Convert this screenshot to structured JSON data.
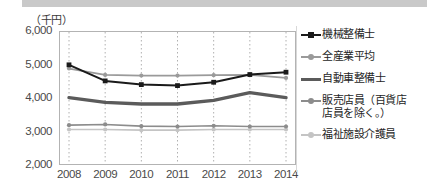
{
  "chart_data": {
    "type": "line",
    "title": "",
    "subtitle": "",
    "xlabel": "",
    "ylabel": "",
    "unit_label": "（千円）",
    "categories": [
      "2008",
      "2009",
      "2010",
      "2011",
      "2012",
      "2013",
      "2014"
    ],
    "ylim": [
      2000,
      6000
    ],
    "yticks": [
      "6,000",
      "5,000",
      "4,000",
      "3,000",
      "2,000"
    ],
    "ytick_values": [
      6000,
      5000,
      4000,
      3000,
      2000
    ],
    "grid": "vertical-dotted",
    "legend_position": "right",
    "series": [
      {
        "name": "機械整備士",
        "color": "#1a1a1a",
        "width": 2.0,
        "marker": "square",
        "values": [
          4990,
          4510,
          4400,
          4370,
          4470,
          4700,
          4770
        ]
      },
      {
        "name": "全産業平均",
        "color": "#9a9a9a",
        "width": 1.8,
        "marker": "dot",
        "values": [
          4880,
          4690,
          4670,
          4670,
          4680,
          4690,
          4600
        ]
      },
      {
        "name": "自動車整備士",
        "color": "#5b5b5b",
        "width": 3.4,
        "marker": "none",
        "values": [
          4010,
          3870,
          3820,
          3820,
          3930,
          4160,
          4010
        ]
      },
      {
        "name": "販売店員（百貨店\n店員を除く。）",
        "color": "#8c8c8c",
        "width": 1.6,
        "marker": "dot",
        "values": [
          3190,
          3210,
          3160,
          3150,
          3170,
          3150,
          3150
        ]
      },
      {
        "name": "福祉施設介護員",
        "color": "#c4c4c4",
        "width": 1.6,
        "marker": "dot",
        "values": [
          3060,
          3060,
          3040,
          3040,
          3060,
          3060,
          3060
        ]
      }
    ]
  }
}
